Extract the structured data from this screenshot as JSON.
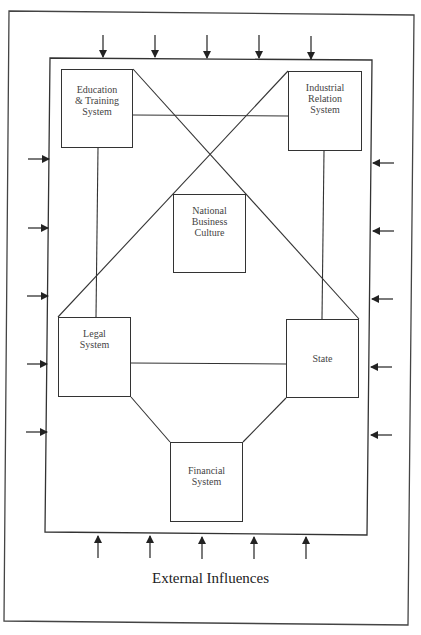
{
  "diagram": {
    "type": "national-business-system-model",
    "caption": "External Influences",
    "nodes": [
      {
        "id": "education",
        "label": "Education\n& Training\nSystem",
        "x": 61,
        "y": 69,
        "w": 72,
        "h": 79,
        "label_top": 14
      },
      {
        "id": "industrial",
        "label": "Industrial\nRelation\nSystem",
        "x": 288,
        "y": 71,
        "w": 74,
        "h": 80,
        "label_top": 10
      },
      {
        "id": "national",
        "label": "National\nBusiness\nCulture",
        "x": 173,
        "y": 194,
        "w": 73,
        "h": 79,
        "label_top": 10
      },
      {
        "id": "legal",
        "label": "Legal\nSystem",
        "x": 58,
        "y": 317,
        "w": 73,
        "h": 80,
        "label_top": 10
      },
      {
        "id": "state",
        "label": "State",
        "x": 286,
        "y": 319,
        "w": 73,
        "h": 79,
        "label_top": 33
      },
      {
        "id": "financial",
        "label": "Financial\nSystem",
        "x": 170,
        "y": 442,
        "w": 73,
        "h": 80,
        "label_top": 22
      }
    ],
    "edges": [
      {
        "from": "education",
        "to": "industrial",
        "kind": "horizontal"
      },
      {
        "from": "education",
        "to": "state",
        "kind": "diagonal"
      },
      {
        "from": "industrial",
        "to": "legal",
        "kind": "diagonal"
      },
      {
        "from": "education",
        "to": "legal",
        "kind": "vertical"
      },
      {
        "from": "industrial",
        "to": "state",
        "kind": "vertical"
      },
      {
        "from": "legal",
        "to": "state",
        "kind": "horizontal"
      },
      {
        "from": "legal",
        "to": "financial",
        "kind": "diagonal"
      },
      {
        "from": "state",
        "to": "financial",
        "kind": "diagonal"
      }
    ],
    "external_arrows": {
      "top_count": 5,
      "bottom_count": 5,
      "left_count": 5,
      "right_count": 5,
      "meaning": "External Influences"
    },
    "colors": {
      "line": "#333333",
      "text": "#444444",
      "background": "#ffffff"
    }
  }
}
